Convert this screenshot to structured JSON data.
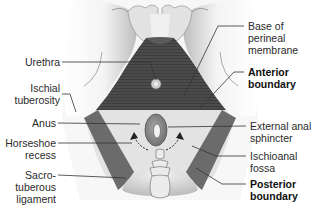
{
  "diagram": {
    "colors": {
      "background": "#ffffff",
      "skin_light": "#f2f2f2",
      "skin_shade": "#c8c8c8",
      "urogenital_muscle": "#4a4a4a",
      "ligament_band": "#6b6b6b",
      "fossa_fill": "#e2e2e2",
      "sphincter": "#8a8a8a",
      "leader_line": "#333333"
    },
    "labels_left": [
      {
        "id": "urethra",
        "lines": [
          "Urethra"
        ]
      },
      {
        "id": "ischial_tuberosity",
        "lines": [
          "Ischial",
          "tuberosity"
        ]
      },
      {
        "id": "anus",
        "lines": [
          "Anus"
        ]
      },
      {
        "id": "horseshoe_recess",
        "lines": [
          "Horseshoe",
          "recess"
        ]
      },
      {
        "id": "sacrotuberous_ligament",
        "lines": [
          "Sacro-",
          "tuberous",
          "ligament"
        ]
      }
    ],
    "labels_right": [
      {
        "id": "base_perineal_membrane",
        "lines": [
          "Base of",
          "perineal",
          "membrane"
        ],
        "bold": false
      },
      {
        "id": "anterior_boundary",
        "lines": [
          "Anterior",
          "boundary"
        ],
        "bold": true
      },
      {
        "id": "external_anal_sphincter",
        "lines": [
          "External anal",
          "sphincter"
        ],
        "bold": false
      },
      {
        "id": "ischioanal_fossa",
        "lines": [
          "Ischioanal",
          "fossa"
        ],
        "bold": false
      },
      {
        "id": "posterior_boundary",
        "lines": [
          "Posterior",
          "boundary"
        ],
        "bold": true
      }
    ]
  }
}
